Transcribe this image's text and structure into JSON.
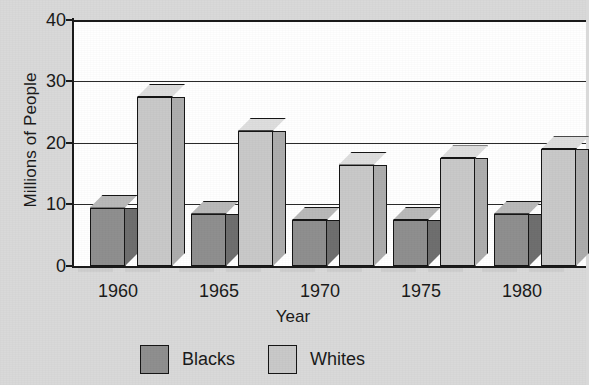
{
  "chart_data": {
    "type": "bar",
    "title": "",
    "xlabel": "Year",
    "ylabel": "Millions of People",
    "categories": [
      "1960",
      "1965",
      "1970",
      "1975",
      "1980"
    ],
    "series": [
      {
        "name": "Blacks",
        "color": "#8f8f8f",
        "values": [
          9.5,
          8.5,
          7.5,
          7.5,
          8.5
        ]
      },
      {
        "name": "Whites",
        "color": "#c9c9c9",
        "values": [
          27.5,
          22.0,
          16.5,
          17.5,
          19.0
        ]
      }
    ],
    "ylim": [
      0,
      40
    ],
    "yticks": [
      0,
      10,
      20,
      30,
      40
    ],
    "ytick_labels": [
      "0",
      "10",
      "20",
      "30",
      "40"
    ],
    "grid": true,
    "grid_axis": "y",
    "legend_position": "bottom",
    "style": "3d-bars",
    "note_clipped_right": "1980 group is cut off at the right edge of the image"
  },
  "axes": {
    "y_label": "Millions of People",
    "x_label": "Year",
    "y_tick_0": "0",
    "y_tick_1": "10",
    "y_tick_2": "20",
    "y_tick_3": "30",
    "y_tick_4": "40",
    "x_tick_0": "1960",
    "x_tick_1": "1965",
    "x_tick_2": "1970",
    "x_tick_3": "1975",
    "x_tick_4": "1980"
  },
  "legend": {
    "items": [
      {
        "label": "Blacks",
        "swatch": "dark"
      },
      {
        "label": "Whites",
        "swatch": "light"
      }
    ]
  },
  "colors": {
    "page_background": "#d9d9d9",
    "plot_background": "#ffffff",
    "axis": "#1b1b1b",
    "dark_bar_front": "#8f8f8f",
    "dark_bar_side": "#6f6f6f",
    "dark_bar_top": "#b9b9b9",
    "light_bar_front": "#c9c9c9",
    "light_bar_side": "#adadad",
    "light_bar_top": "#dedede"
  }
}
